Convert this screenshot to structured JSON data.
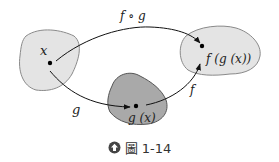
{
  "diagram": {
    "sets": [
      {
        "id": "domain-x",
        "fill": "#e4e4e4",
        "stroke": "#8a8a8a"
      },
      {
        "id": "set-gx",
        "fill": "#a9a9a9",
        "stroke": "#555555"
      },
      {
        "id": "set-fgx",
        "fill": "#e4e4e4",
        "stroke": "#8a8a8a"
      }
    ],
    "points": {
      "x_label": "x",
      "gx_label": "g (x)",
      "fgx_label": "f (g (x))"
    },
    "arrows": {
      "composition_label": "f ∘ g",
      "g_label": "g",
      "f_label": "f"
    }
  },
  "caption": {
    "icon": "circle-arrow-icon",
    "text": "圖 1-14"
  }
}
